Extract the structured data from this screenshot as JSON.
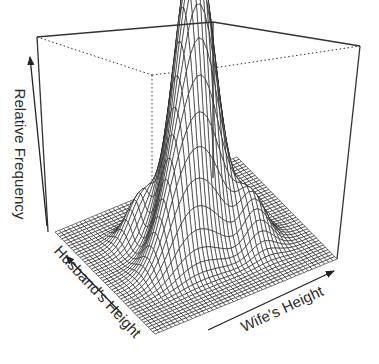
{
  "chart_data": {
    "type": "surface3d",
    "title": "",
    "xlabel": "Wife's Height",
    "ylabel": "Husband's Height",
    "zlabel": "Relative Frequency",
    "grid_resolution": 44,
    "style": {
      "mesh_color": "#1a1a1a",
      "face_color": "#ffffff",
      "box_color": "#333333"
    },
    "components": [
      {
        "mx": 0.5,
        "my": 0.52,
        "sx": 0.1,
        "sy": 0.1,
        "w": 1.0
      },
      {
        "mx": 0.6,
        "my": 0.62,
        "sx": 0.08,
        "sy": 0.07,
        "w": 0.35
      },
      {
        "mx": 0.35,
        "my": 0.4,
        "sx": 0.1,
        "sy": 0.08,
        "w": 0.3
      },
      {
        "mx": 0.72,
        "my": 0.35,
        "sx": 0.07,
        "sy": 0.08,
        "w": 0.18
      },
      {
        "mx": 0.3,
        "my": 0.7,
        "sx": 0.07,
        "sy": 0.06,
        "w": 0.15
      }
    ]
  },
  "box": {
    "front_bottom": [
      155,
      334
    ],
    "left_bottom": [
      55,
      232
    ],
    "right_bottom": [
      337,
      259
    ],
    "back_bottom": [
      213,
      178
    ],
    "left_top": [
      37,
      37
    ],
    "right_top": [
      360,
      46
    ],
    "back_top": [
      213,
      22
    ],
    "back_inner": [
      152,
      75
    ]
  },
  "axes": {
    "z_label": "Relative Frequency",
    "husband_label": "Husband's Height",
    "wife_label": "Wife's Height"
  }
}
